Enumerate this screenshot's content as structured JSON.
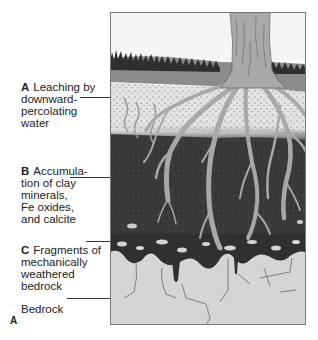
{
  "figure": {
    "letter": "A"
  },
  "labels": [
    {
      "key": "A",
      "text": "Leaching by\ndownward-\npercolating\nwater"
    },
    {
      "key": "B",
      "text": "Accumula-\ntion of clay\nminerals,\nFe oxides,\nand calcite"
    },
    {
      "key": "C",
      "text": "Fragments of\nmechanically\nweathered\nbedrock"
    },
    {
      "key": "",
      "text": "Bedrock"
    }
  ],
  "colors": {
    "sky": "#f4f4f4",
    "grass": "#3a3a3a",
    "topsoil": "#8a8a8a",
    "horizon_a": "#e2e2e2",
    "horizon_b": "#3c3c3c",
    "bedrock": "#d4d4d4",
    "roots": "#a8a8a8",
    "frame": "#777777"
  }
}
